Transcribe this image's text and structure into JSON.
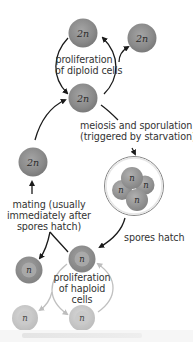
{
  "diagram": {
    "colors": {
      "diploid_cell": "#8a8a8a",
      "diploid_cell_highlight": "#a8a8a8",
      "haploid_dark": "#8c8c8c",
      "haploid_light": "#c6c6c6",
      "haploid_core": "#b4b4b4",
      "arrow_dark": "#1a1a1a",
      "arrow_light": "#bdbdbd",
      "text": "#333333",
      "spore_wall": "#777777"
    },
    "cells": {
      "diploid_top": {
        "label": "2n"
      },
      "diploid_right": {
        "label": "2n"
      },
      "diploid_middle": {
        "label": "2n"
      },
      "diploid_left": {
        "label": "2n"
      },
      "spore_1": {
        "label": "n"
      },
      "spore_2": {
        "label": "n"
      },
      "spore_3": {
        "label": "n"
      },
      "spore_4": {
        "label": "n"
      },
      "haploid_top": {
        "label": "n"
      },
      "haploid_left": {
        "label": "n"
      },
      "haploid_bottom_left": {
        "label": "n"
      },
      "haploid_bottom": {
        "label": "n"
      }
    },
    "labels": {
      "diploid_proliferation_line1": "proliferation",
      "diploid_proliferation_line2": "of diploid cells",
      "meiosis_line1": "meiosis and sporulation",
      "meiosis_line2": "(triggered by starvation)",
      "mating_line1": "mating (usually",
      "mating_line2": "immediately after",
      "mating_line3": "spores hatch)",
      "spores_hatch": "spores hatch",
      "haploid_proliferation_line1": "proliferation",
      "haploid_proliferation_line2": "of haploid",
      "haploid_proliferation_line3": "cells"
    }
  }
}
